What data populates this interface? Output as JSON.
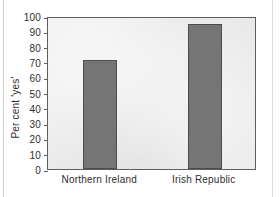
{
  "chart_data": {
    "type": "bar",
    "title": "",
    "xlabel": "",
    "ylabel": "Per cent 'yes'",
    "categories": [
      "Northern Ireland",
      "Irish Republic"
    ],
    "values": [
      71,
      95
    ],
    "ylim": [
      0,
      100
    ],
    "yticks": [
      0,
      10,
      20,
      30,
      40,
      50,
      60,
      70,
      80,
      90,
      100
    ],
    "ytick_labels": [
      "0",
      "10",
      "20",
      "30",
      "40",
      "50",
      "60",
      "70",
      "80",
      "90",
      "100"
    ],
    "grid": false,
    "legend": false,
    "colors": {
      "bar_fill": "#757575",
      "bar_edge": "#4c4c4c",
      "plot_background": "#e9e9e9",
      "axis": "#5e5e5e",
      "text": "#2e2e2e",
      "page_background": "#ffffff"
    }
  }
}
